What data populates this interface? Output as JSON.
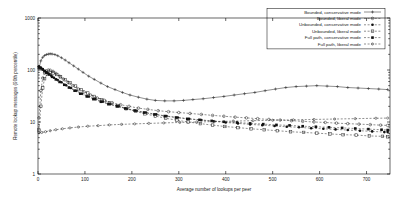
{
  "chart_data": {
    "type": "line",
    "title": "",
    "xlabel": "Average number of lookups per peer",
    "ylabel": "Remote lookup messages (90th percentile)",
    "xlim": [
      0,
      750
    ],
    "ylim": [
      1,
      1000
    ],
    "yscale": "log",
    "xscale": "linear",
    "grid": false,
    "legend_position": "top-right",
    "xticks": [
      0,
      100,
      200,
      300,
      400,
      500,
      600,
      700
    ],
    "xtick_labels": [
      "0",
      "100",
      "200",
      "300",
      "400",
      "500",
      "600",
      "700"
    ],
    "yticks": [
      1,
      10,
      100,
      1000
    ],
    "ytick_labels": [
      "1",
      "10",
      "100",
      "1000"
    ],
    "series": [
      {
        "name": "Bounded, conservative mode",
        "marker": "plus",
        "linestyle": "solid",
        "x": [
          2,
          6,
          10,
          14,
          18,
          22,
          26,
          30,
          36,
          42,
          50,
          58,
          66,
          76,
          86,
          96,
          108,
          120,
          134,
          148,
          164,
          180,
          196,
          214,
          232,
          250,
          270,
          290,
          310,
          330,
          352,
          374,
          396,
          418,
          440,
          462,
          484,
          506,
          528,
          550,
          572,
          594,
          616,
          638,
          660,
          682,
          704,
          726,
          745
        ],
        "y": [
          105,
          150,
          175,
          190,
          198,
          202,
          205,
          203,
          198,
          188,
          172,
          155,
          138,
          120,
          104,
          90,
          76,
          66,
          56,
          48,
          42,
          37,
          33,
          30,
          27.5,
          26,
          25.5,
          25.5,
          26,
          27,
          28,
          29.5,
          31,
          33,
          35,
          37,
          40,
          43,
          46,
          48,
          49,
          50,
          49,
          48,
          46,
          45,
          44,
          43,
          42
        ]
      },
      {
        "name": "Bounded, liberal mode",
        "marker": "open-circle",
        "linestyle": "dashed",
        "x": [
          2,
          6,
          10,
          14,
          18,
          22,
          26,
          32,
          38,
          46,
          54,
          64,
          74,
          86,
          98,
          112,
          126,
          142,
          158,
          176,
          194,
          214,
          234,
          256,
          278,
          300,
          324,
          348,
          372,
          396,
          420,
          444,
          468,
          492,
          516,
          540,
          564,
          588,
          612,
          636,
          660,
          684,
          708,
          730,
          745
        ],
        "y": [
          12,
          40,
          70,
          88,
          96,
          100,
          99,
          94,
          86,
          76,
          67,
          58,
          50,
          43,
          38,
          33,
          29,
          26,
          23.5,
          21.5,
          20,
          18.5,
          17.5,
          16.5,
          15.8,
          15.2,
          14.6,
          14.0,
          13.4,
          12.9,
          12.4,
          12.0,
          11.6,
          11.2,
          10.9,
          10.6,
          10.3,
          10.0,
          9.8,
          9.5,
          9.3,
          9.1,
          8.9,
          8.7,
          8.6
        ]
      },
      {
        "name": "Unbounded, conservative mode",
        "marker": "filled-circle",
        "linestyle": "dashed",
        "x": [
          2,
          6,
          10,
          14,
          18,
          22,
          28,
          34,
          42,
          50,
          60,
          70,
          82,
          94,
          108,
          122,
          138,
          154,
          172,
          190,
          210,
          230,
          252,
          274,
          298,
          322,
          348,
          374,
          400,
          426,
          452,
          478,
          504,
          530,
          556,
          582,
          608,
          634,
          660,
          686,
          712,
          738,
          745
        ],
        "y": [
          118,
          112,
          104,
          96,
          90,
          85,
          78,
          71,
          64,
          58,
          51,
          45,
          40,
          35,
          31,
          27.5,
          24.5,
          22,
          20,
          18,
          16.5,
          15.2,
          14.0,
          13.0,
          12.2,
          11.5,
          10.9,
          10.3,
          9.8,
          9.4,
          9.0,
          8.7,
          8.4,
          8.1,
          7.9,
          7.6,
          7.4,
          7.2,
          7.0,
          6.8,
          6.6,
          6.4,
          6.4
        ]
      },
      {
        "name": "Unbounded, liberal mode",
        "marker": "open-square",
        "linestyle": "dashed",
        "x": [
          2,
          6,
          10,
          14,
          20,
          26,
          32,
          40,
          48,
          58,
          68,
          80,
          92,
          106,
          120,
          136,
          152,
          170,
          188,
          208,
          228,
          250,
          272,
          296,
          320,
          346,
          372,
          398,
          426,
          454,
          482,
          510,
          538,
          566,
          594,
          622,
          650,
          678,
          706,
          734,
          745
        ],
        "y": [
          7,
          20,
          45,
          68,
          84,
          90,
          88,
          82,
          74,
          65,
          57,
          49,
          42,
          36,
          31,
          27,
          23.5,
          20.5,
          18,
          16,
          14.4,
          13.0,
          11.8,
          10.8,
          10.0,
          9.3,
          8.7,
          8.2,
          7.8,
          7.4,
          7.1,
          6.8,
          6.5,
          6.3,
          6.1,
          5.9,
          5.7,
          5.6,
          5.4,
          5.3,
          5.2
        ]
      },
      {
        "name": "Full path, conservative mode",
        "marker": "filled-square",
        "linestyle": "dashed",
        "x": [
          2,
          6,
          10,
          14,
          18,
          24,
          30,
          38,
          46,
          56,
          66,
          78,
          90,
          104,
          118,
          134,
          150,
          168,
          186,
          206,
          226,
          248,
          270,
          294,
          318,
          344,
          370,
          396,
          424,
          452,
          480,
          508,
          536,
          564,
          592,
          620,
          648,
          676,
          704,
          732,
          745
        ],
        "y": [
          112,
          108,
          102,
          95,
          89,
          82,
          74,
          66,
          59,
          52,
          46,
          40,
          35,
          31,
          27.5,
          24.5,
          22,
          20,
          18.2,
          16.6,
          15.2,
          14.0,
          13.0,
          12.2,
          11.5,
          11.0,
          10.5,
          10.1,
          9.8,
          9.4,
          9.1,
          8.8,
          8.6,
          8.3,
          8.1,
          7.9,
          7.7,
          7.5,
          7.3,
          7.1,
          7.0
        ]
      },
      {
        "name": "Full path, liberal mode",
        "marker": "open-circle-small",
        "linestyle": "dashed",
        "x": [
          2,
          8,
          16,
          26,
          38,
          52,
          68,
          86,
          106,
          128,
          152,
          178,
          206,
          236,
          268,
          302,
          338,
          376,
          416,
          458,
          500,
          544,
          588,
          632,
          676,
          720,
          745
        ],
        "y": [
          6.2,
          6.3,
          6.5,
          6.8,
          7.1,
          7.4,
          7.7,
          8.0,
          8.3,
          8.5,
          8.8,
          9.0,
          9.2,
          9.4,
          9.6,
          9.8,
          10.0,
          10.2,
          10.4,
          10.6,
          10.8,
          11.0,
          11.2,
          11.4,
          11.6,
          11.8,
          11.9
        ]
      }
    ]
  },
  "legend": {
    "entries": [
      "Bounded, conservative mode",
      "Bounded, liberal mode",
      "Unbounded, conservative mode",
      "Unbounded, liberal mode",
      "Full path, conservative mode",
      "Full path, liberal mode"
    ]
  }
}
